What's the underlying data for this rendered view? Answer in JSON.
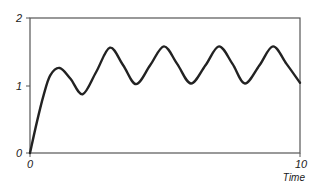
{
  "chart_data": {
    "type": "line",
    "title": "",
    "xlabel": "Time",
    "ylabel": "",
    "xlim": [
      0,
      10
    ],
    "ylim": [
      0,
      2
    ],
    "grid": false,
    "legend": null,
    "x_ticks": [
      {
        "value": 0,
        "label": "0"
      },
      {
        "value": 10,
        "label": "10"
      }
    ],
    "y_ticks": [
      {
        "value": 0,
        "label": "0"
      },
      {
        "value": 1,
        "label": "1"
      },
      {
        "value": 2,
        "label": "2"
      }
    ],
    "series": [
      {
        "name": "response",
        "color": "#222222",
        "x": [
          0,
          0.25,
          0.5,
          0.75,
          1.1,
          1.5,
          1.95,
          2.45,
          2.96,
          3.45,
          3.93,
          4.45,
          4.96,
          5.45,
          5.96,
          6.5,
          7.0,
          7.5,
          7.96,
          8.5,
          9.0,
          9.5,
          10.0
        ],
        "y": [
          0,
          0.45,
          0.85,
          1.15,
          1.26,
          1.1,
          0.87,
          1.2,
          1.56,
          1.3,
          1.02,
          1.3,
          1.58,
          1.32,
          1.03,
          1.3,
          1.58,
          1.32,
          1.03,
          1.3,
          1.58,
          1.32,
          1.04
        ]
      }
    ],
    "annotations": []
  },
  "labels": {
    "y0": "0",
    "y1": "1",
    "y2": "2",
    "x0": "0",
    "x10": "10",
    "xtitle": "Time"
  }
}
